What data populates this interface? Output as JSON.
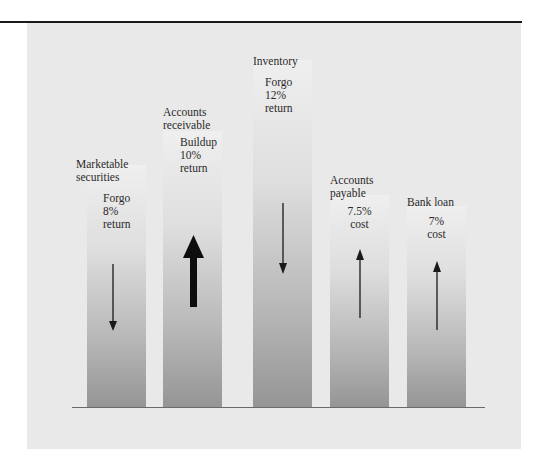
{
  "figure": {
    "categories": [
      {
        "name": "Marketable securities",
        "label_lines": [
          "Marketable",
          "securities"
        ],
        "note_lines": [
          "Forgo",
          "8%",
          "return"
        ],
        "arrow": "down",
        "arrow_weight": "thin"
      },
      {
        "name": "Accounts receivable",
        "label_lines": [
          "Accounts",
          "receivable"
        ],
        "note_lines": [
          "Buildup",
          "10%",
          "return"
        ],
        "arrow": "up",
        "arrow_weight": "thick"
      },
      {
        "name": "Inventory",
        "label_lines": [
          "Inventory"
        ],
        "note_lines": [
          "Forgo",
          "12%",
          "return"
        ],
        "arrow": "down",
        "arrow_weight": "thin"
      },
      {
        "name": "Accounts payable",
        "label_lines": [
          "Accounts",
          "payable"
        ],
        "note_lines": [
          "7.5%",
          "cost"
        ],
        "arrow": "up",
        "arrow_weight": "thin"
      },
      {
        "name": "Bank loan",
        "label_lines": [
          "Bank loan"
        ],
        "note_lines": [
          "7%",
          "cost"
        ],
        "arrow": "up",
        "arrow_weight": "thin"
      }
    ],
    "colors": {
      "rule": "#1a1a1a",
      "panel": "#e9e9e9",
      "bar_top": "#efefef",
      "bar_bottom": "#959595",
      "arrow": "#1a1a1a"
    }
  }
}
